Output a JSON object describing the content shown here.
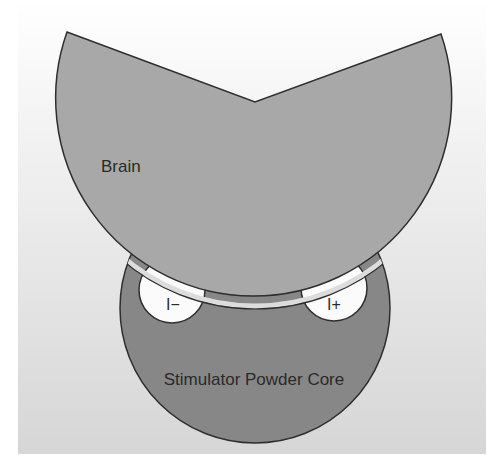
{
  "diagram": {
    "type": "schematic",
    "background": {
      "gradient_top": "#ffffff",
      "gradient_bottom": "#d8d8d8"
    },
    "brain": {
      "label": "Brain",
      "fill": "#a9a9a9",
      "stroke": "#333333"
    },
    "core": {
      "label": "Stimulator Powder Core",
      "fill": "#868686",
      "stroke": "#333333"
    },
    "gap": {
      "fill": "#d6d6d6"
    },
    "electrodes": [
      {
        "label": "I−",
        "name": "negative-electrode",
        "fill": "#fdfdfd"
      },
      {
        "label": "I+",
        "name": "positive-electrode",
        "fill": "#fdfdfd"
      }
    ]
  }
}
